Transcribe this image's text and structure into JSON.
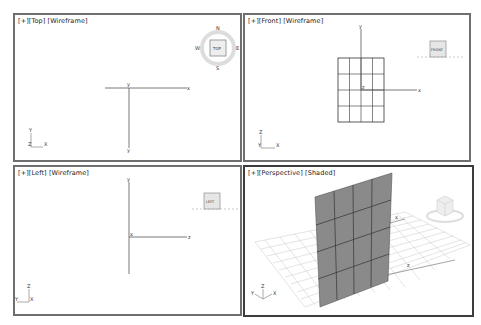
{
  "viewports": [
    {
      "id": "top",
      "menu_plus": "[+]",
      "view_name": "[Top]",
      "shading": "[Wireframe]",
      "viewcube": {
        "face_label": "TOP",
        "compass": {
          "north": "N",
          "south": "S",
          "east": "E",
          "west": "W"
        }
      },
      "axis_labels": {
        "h_end": "x",
        "v_top": "y",
        "v_bottom": "y"
      },
      "tripod": {
        "up": "Y",
        "right": "X",
        "origin": "Z"
      },
      "active": false
    },
    {
      "id": "front",
      "menu_plus": "[+]",
      "view_name": "[Front]",
      "shading": "[Wireframe]",
      "viewcube": {
        "face_label": "FRONT"
      },
      "axis_labels": {
        "h_end": "x",
        "v_top": "y",
        "center": "z"
      },
      "tripod": {
        "up": "Z",
        "right": "X",
        "origin": "Y"
      },
      "active": false
    },
    {
      "id": "left",
      "menu_plus": "[+]",
      "view_name": "[Left]",
      "shading": "[Wireframe]",
      "viewcube": {
        "face_label": "LEFT"
      },
      "axis_labels": {
        "h_end": "z",
        "v_top": "y",
        "center": "x"
      },
      "tripod": {
        "up": "Z",
        "left": "Y",
        "origin": "X"
      },
      "active": false
    },
    {
      "id": "perspective",
      "menu_plus": "[+]",
      "view_name": "[Perspective]",
      "shading": "[Shaded]",
      "viewcube": {
        "face_label": ""
      },
      "axis_labels": {
        "x": "x",
        "z": "z"
      },
      "tripod": {
        "up": "Z",
        "left": "Y",
        "right": "X"
      },
      "active": true
    }
  ],
  "plane_object": {
    "segments_width": 4,
    "segments_length": 4,
    "color": "#8a8a8a"
  },
  "colors": {
    "viewport_border": "#6e6e6e",
    "active_border": "#3c3c3c",
    "grid": "#c8c8c8",
    "background": "#ffffff"
  }
}
